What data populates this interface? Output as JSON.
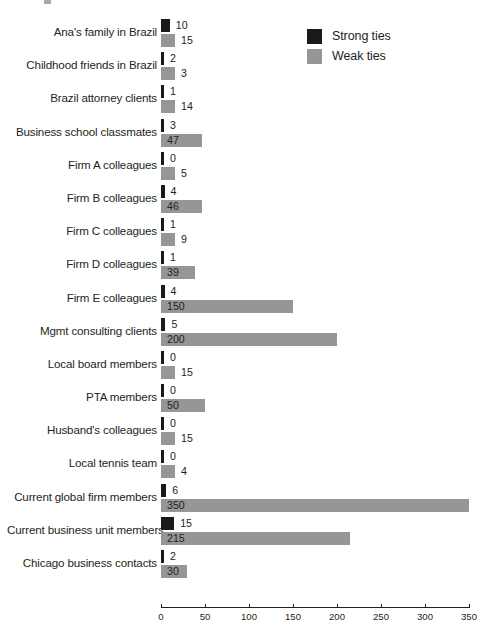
{
  "legend": {
    "position": "top-right",
    "items": [
      {
        "label": "Strong ties",
        "color": "#1a1a1a",
        "swatch": "legend-swatch-strong"
      },
      {
        "label": "Weak ties",
        "color": "#969696",
        "swatch": "legend-swatch-weak"
      }
    ]
  },
  "axis": {
    "ticks": [
      "0",
      "50",
      "100",
      "150",
      "200",
      "250",
      "300",
      "350"
    ],
    "min": 0,
    "max": 350,
    "step": 50
  },
  "chart_data": {
    "type": "bar",
    "orientation": "horizontal",
    "title": "",
    "subtitle": "",
    "xlabel": "",
    "ylabel": "",
    "xlim": [
      0,
      350
    ],
    "xticks": [
      0,
      50,
      100,
      150,
      200,
      250,
      300,
      350
    ],
    "grid": false,
    "legend": [
      "Strong ties",
      "Weak ties"
    ],
    "legend_position": "top-right",
    "data_labels": true,
    "categories": [
      "Ana's family in Brazil",
      "Childhood friends in Brazil",
      "Brazil attorney clients",
      "Business school classmates",
      "Firm A colleagues",
      "Firm B colleagues",
      "Firm C colleagues",
      "Firm D colleagues",
      "Firm E colleagues",
      "Mgmt consulting clients",
      "Local board members",
      "PTA members",
      "Husband's colleagues",
      "Local tennis team",
      "Current global firm members",
      "Current business unit members",
      "Chicago business contacts"
    ],
    "series": [
      {
        "name": "Strong ties",
        "color": "#1a1a1a",
        "values": [
          10,
          2,
          1,
          3,
          0,
          4,
          1,
          1,
          4,
          5,
          0,
          0,
          0,
          0,
          6,
          15,
          2
        ]
      },
      {
        "name": "Weak ties",
        "color": "#969696",
        "values": [
          15,
          3,
          14,
          47,
          5,
          46,
          9,
          39,
          150,
          200,
          15,
          50,
          15,
          4,
          350,
          215,
          30
        ]
      }
    ]
  }
}
